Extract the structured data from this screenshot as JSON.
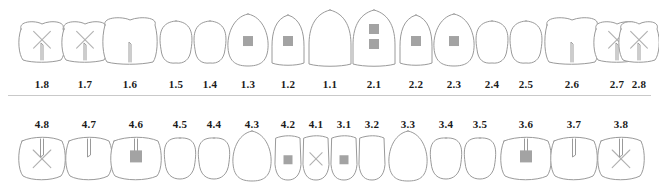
{
  "chart": {
    "background_color": "#ffffff",
    "outline_color": "#9a9a9a",
    "filling_color": "#a3a3a3",
    "mark_color": "#b0b0b0",
    "number_color": "#1a1a1a",
    "divider_color": "#c9c9c9",
    "notation": "FDI",
    "quadrants": [
      {
        "id": "upper-right",
        "label_position": "below",
        "teeth": [
          {
            "number": "1.8",
            "type": "molar",
            "cx": 42,
            "cy": 42,
            "w": 46,
            "h": 38,
            "markings": [
              "x-mark",
              "root-notch"
            ]
          },
          {
            "number": "1.7",
            "type": "molar",
            "cx": 85,
            "cy": 42,
            "w": 46,
            "h": 38,
            "markings": [
              "x-mark",
              "root-notch"
            ]
          },
          {
            "number": "1.6",
            "type": "molar",
            "cx": 130,
            "cy": 41,
            "w": 54,
            "h": 44,
            "markings": [
              "root-notch"
            ]
          },
          {
            "number": "1.5",
            "type": "premolar",
            "cx": 176,
            "cy": 42,
            "w": 34,
            "h": 42,
            "markings": []
          },
          {
            "number": "1.4",
            "type": "premolar",
            "cx": 210,
            "cy": 42,
            "w": 34,
            "h": 42,
            "markings": []
          },
          {
            "number": "1.3",
            "type": "canine",
            "cx": 248,
            "cy": 40,
            "w": 42,
            "h": 52,
            "markings": [
              "square-filling"
            ]
          },
          {
            "number": "1.2",
            "type": "incisor",
            "cx": 288,
            "cy": 40,
            "w": 34,
            "h": 50,
            "markings": [
              "square-filling"
            ]
          },
          {
            "number": "1.1",
            "type": "incisor",
            "cx": 330,
            "cy": 38,
            "w": 44,
            "h": 56,
            "markings": []
          }
        ]
      },
      {
        "id": "upper-left",
        "label_position": "below",
        "teeth": [
          {
            "number": "2.1",
            "type": "incisor",
            "cx": 374,
            "cy": 38,
            "w": 44,
            "h": 56,
            "markings": [
              "square-filling",
              "square-filling"
            ]
          },
          {
            "number": "2.2",
            "type": "incisor",
            "cx": 416,
            "cy": 40,
            "w": 34,
            "h": 50,
            "markings": [
              "square-filling"
            ]
          },
          {
            "number": "2.3",
            "type": "canine",
            "cx": 454,
            "cy": 40,
            "w": 42,
            "h": 52,
            "markings": [
              "square-filling"
            ]
          },
          {
            "number": "2.4",
            "type": "premolar",
            "cx": 492,
            "cy": 42,
            "w": 34,
            "h": 42,
            "markings": []
          },
          {
            "number": "2.5",
            "type": "premolar",
            "cx": 526,
            "cy": 42,
            "w": 34,
            "h": 42,
            "markings": []
          },
          {
            "number": "2.6",
            "type": "molar",
            "cx": 572,
            "cy": 41,
            "w": 54,
            "h": 44,
            "markings": [
              "root-notch"
            ]
          },
          {
            "number": "2.7",
            "type": "molar",
            "cx": 617,
            "cy": 42,
            "w": 46,
            "h": 38,
            "markings": [
              "x-mark",
              "root-notch"
            ]
          },
          {
            "number": "2.8",
            "type": "molar",
            "cx": 639,
            "cy": 42,
            "w": 40,
            "h": 38,
            "markings": [
              "x-mark",
              "root-notch"
            ]
          }
        ]
      },
      {
        "id": "lower-right",
        "label_position": "above",
        "teeth": [
          {
            "number": "4.8",
            "type": "molar",
            "cx": 42,
            "cy": 158,
            "w": 46,
            "h": 40,
            "markings": [
              "x-mark",
              "crown-notch"
            ]
          },
          {
            "number": "4.7",
            "type": "molar",
            "cx": 89,
            "cy": 158,
            "w": 46,
            "h": 40,
            "markings": [
              "crown-notch"
            ]
          },
          {
            "number": "4.6",
            "type": "molar",
            "cx": 136,
            "cy": 158,
            "w": 50,
            "h": 40,
            "markings": [
              "crown-notch",
              "square-filling"
            ]
          },
          {
            "number": "4.5",
            "type": "premolar",
            "cx": 180,
            "cy": 158,
            "w": 34,
            "h": 42,
            "markings": []
          },
          {
            "number": "4.4",
            "type": "premolar",
            "cx": 214,
            "cy": 158,
            "w": 34,
            "h": 42,
            "markings": []
          },
          {
            "number": "4.3",
            "type": "canine",
            "cx": 252,
            "cy": 156,
            "w": 40,
            "h": 50,
            "markings": []
          },
          {
            "number": "4.2",
            "type": "incisor",
            "cx": 288,
            "cy": 158,
            "w": 28,
            "h": 44,
            "markings": [
              "square-filling"
            ]
          },
          {
            "number": "4.1",
            "type": "incisor",
            "cx": 316,
            "cy": 158,
            "w": 28,
            "h": 44,
            "markings": [
              "x-mark"
            ]
          }
        ]
      },
      {
        "id": "lower-left",
        "label_position": "above",
        "teeth": [
          {
            "number": "3.1",
            "type": "incisor",
            "cx": 344,
            "cy": 158,
            "w": 28,
            "h": 44,
            "markings": [
              "square-filling"
            ]
          },
          {
            "number": "3.2",
            "type": "incisor",
            "cx": 372,
            "cy": 158,
            "w": 28,
            "h": 44,
            "markings": []
          },
          {
            "number": "3.3",
            "type": "canine",
            "cx": 408,
            "cy": 156,
            "w": 40,
            "h": 50,
            "markings": []
          },
          {
            "number": "3.4",
            "type": "premolar",
            "cx": 446,
            "cy": 158,
            "w": 34,
            "h": 42,
            "markings": []
          },
          {
            "number": "3.5",
            "type": "premolar",
            "cx": 480,
            "cy": 158,
            "w": 34,
            "h": 42,
            "markings": []
          },
          {
            "number": "3.6",
            "type": "molar",
            "cx": 526,
            "cy": 158,
            "w": 50,
            "h": 40,
            "markings": [
              "crown-notch",
              "square-filling"
            ]
          },
          {
            "number": "3.7",
            "type": "molar",
            "cx": 574,
            "cy": 158,
            "w": 46,
            "h": 40,
            "markings": [
              "crown-notch"
            ]
          },
          {
            "number": "3.8",
            "type": "molar",
            "cx": 621,
            "cy": 158,
            "w": 46,
            "h": 40,
            "markings": [
              "x-mark",
              "crown-notch"
            ]
          }
        ]
      }
    ],
    "number_rows": {
      "upper": {
        "y": 78,
        "numbers": [
          "1.8",
          "1.7",
          "1.6",
          "1.5",
          "1.4",
          "1.3",
          "1.2",
          "1.1",
          "2.1",
          "2.2",
          "2.3",
          "2.4",
          "2.5",
          "2.6",
          "2.7",
          "2.8"
        ]
      },
      "lower": {
        "y": 118,
        "numbers": [
          "4.8",
          "4.7",
          "4.6",
          "4.5",
          "4.4",
          "4.3",
          "4.2",
          "4.1",
          "3.1",
          "3.2",
          "3.3",
          "3.4",
          "3.5",
          "3.6",
          "3.7",
          "3.8"
        ]
      }
    }
  }
}
